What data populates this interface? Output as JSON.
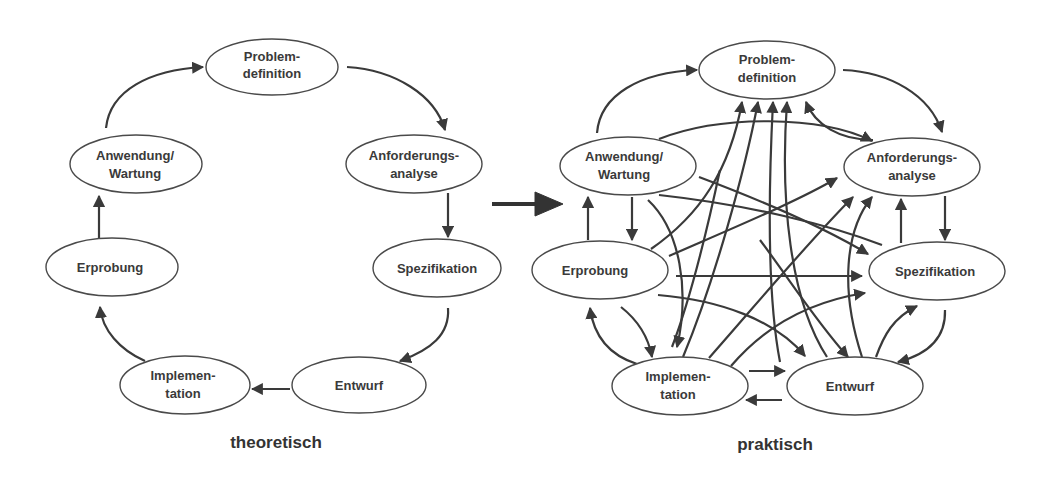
{
  "diagrams": {
    "theoretical": {
      "caption": "theoretisch",
      "nodes": {
        "problem": {
          "line1": "Problem-",
          "line2": "definition"
        },
        "requirements": {
          "line1": "Anforderungs-",
          "line2": "analyse"
        },
        "specification": {
          "line1": "Spezifikation"
        },
        "design": {
          "line1": "Entwurf"
        },
        "implementation": {
          "line1": "Implemen-",
          "line2": "tation"
        },
        "testing": {
          "line1": "Erprobung"
        },
        "operation": {
          "line1": "Anwendung/",
          "line2": "Wartung"
        }
      },
      "edges": [
        [
          "Anwendung/Wartung",
          "Problemdefinition"
        ],
        [
          "Problemdefinition",
          "Anforderungsanalyse"
        ],
        [
          "Anforderungsanalyse",
          "Spezifikation"
        ],
        [
          "Spezifikation",
          "Entwurf"
        ],
        [
          "Entwurf",
          "Implementation"
        ],
        [
          "Implementation",
          "Erprobung"
        ],
        [
          "Erprobung",
          "Anwendung/Wartung"
        ]
      ]
    },
    "transition_arrow": "theoretisch-to-praktisch",
    "practical": {
      "caption": "praktisch",
      "nodes": {
        "problem": {
          "line1": "Problem-",
          "line2": "definition"
        },
        "requirements": {
          "line1": "Anforderungs-",
          "line2": "analyse"
        },
        "specification": {
          "line1": "Spezifikation"
        },
        "design": {
          "line1": "Entwurf"
        },
        "implementation": {
          "line1": "Implemen-",
          "line2": "tation"
        },
        "testing": {
          "line1": "Erprobung"
        },
        "operation": {
          "line1": "Anwendung/",
          "line2": "Wartung"
        }
      }
    }
  },
  "colors": {
    "stroke": "#3a3a3a",
    "text": "#3a3a3a",
    "background": "#ffffff"
  }
}
